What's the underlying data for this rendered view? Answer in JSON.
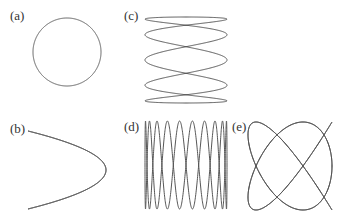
{
  "figure": {
    "stroke_color": "#555555",
    "background": "#ffffff"
  },
  "panels": [
    {
      "label": "(a)",
      "label_pos": [
        10,
        8
      ],
      "shape": "circle",
      "fx": 1,
      "fy": 1,
      "phase": 1.5708,
      "cx": 67,
      "cy": 52,
      "rx": 34,
      "ry": 34
    },
    {
      "label": "(b)",
      "label_pos": [
        10,
        121
      ],
      "shape": "figure-eight",
      "fx": 2,
      "fy": 1,
      "phase": 1.5708,
      "cx": 67,
      "cy": 170,
      "rx": 39,
      "ry": 39
    },
    {
      "label": "(c)",
      "label_pos": [
        124,
        8
      ],
      "shape": "lissajous",
      "fx": 5,
      "fy": 1,
      "phase": 1.5708,
      "cx": 186,
      "cy": 60,
      "rx": 41,
      "ry": 43
    },
    {
      "label": "(d)",
      "label_pos": [
        124,
        119
      ],
      "shape": "lissajous",
      "fx": 1,
      "fy": 10,
      "phase": 1.5708,
      "cx": 186,
      "cy": 165,
      "rx": 41,
      "ry": 44
    },
    {
      "label": "(e)",
      "label_pos": [
        232,
        119
      ],
      "shape": "lissajous",
      "fx": 4,
      "fy": 5,
      "phase": 1.5708,
      "cx": 290,
      "cy": 166,
      "rx": 42,
      "ry": 44
    }
  ]
}
